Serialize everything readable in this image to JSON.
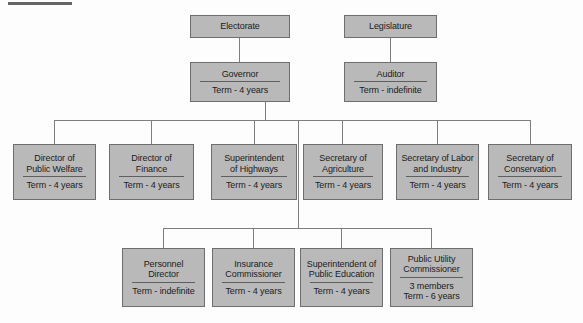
{
  "diagram": {
    "type": "organization-chart",
    "background_color": "#fdfdfd",
    "node_fill_color": "#b9b9b9",
    "node_border_color": "#6e6e6e",
    "connector_color": "#7d7d7d"
  },
  "nodes": {
    "electorate": {
      "title": "Electorate",
      "term": ""
    },
    "legislature": {
      "title": "Legislature",
      "term": ""
    },
    "governor": {
      "title": "Governor",
      "term": "Term - 4 years"
    },
    "auditor": {
      "title": "Auditor",
      "term": "Term - indefinite"
    },
    "public_welfare": {
      "title": "Director of\nPublic Welfare",
      "term": "Term - 4 years"
    },
    "finance": {
      "title": "Director of\nFinance",
      "term": "Term - 4 years"
    },
    "highways": {
      "title": "Superintendent\nof Highways",
      "term": "Term - 4 years"
    },
    "agriculture": {
      "title": "Secretary of\nAgriculture",
      "term": "Term - 4 years"
    },
    "labor_industry": {
      "title": "Secretary of Labor\nand Industry",
      "term": "Term - 4 years"
    },
    "conservation": {
      "title": "Secretary of\nConservation",
      "term": "Term - 4 years"
    },
    "personnel": {
      "title": "Personnel\nDirector",
      "term": "Term - indefinite"
    },
    "insurance": {
      "title": "Insurance\nCommissioner",
      "term": "Term - 4 years"
    },
    "public_education": {
      "title": "Superintendent of\nPublic Education",
      "term": "Term - 4  years"
    },
    "public_utility": {
      "title": "Public Utility\nCommissioner",
      "term": "3 members\nTerm - 6 years"
    }
  }
}
